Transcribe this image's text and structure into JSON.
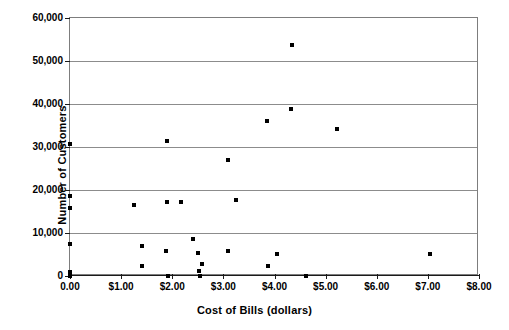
{
  "chart_data": {
    "type": "scatter",
    "title": "",
    "xlabel": "Cost of Bills (dollars)",
    "ylabel": "Number of Customers",
    "xlim": [
      0,
      8
    ],
    "ylim": [
      0,
      60000
    ],
    "grid": "horizontal",
    "legend": "none",
    "marker_color": "#000000",
    "xticks": [
      0,
      1,
      2,
      3,
      4,
      5,
      6,
      7,
      8
    ],
    "xtick_labels": [
      "0.00",
      "$1.00",
      "$2.00",
      "$3.00",
      "$4.00",
      "$5.00",
      "$6.00",
      "$7.00",
      "$8.00"
    ],
    "yticks": [
      0,
      10000,
      20000,
      30000,
      40000,
      50000,
      60000
    ],
    "ytick_labels": [
      "0",
      "10,000",
      "20,000",
      "30,000",
      "40,000",
      "50,000",
      "60,000"
    ],
    "points": [
      {
        "x": 0.0,
        "y": 30700
      },
      {
        "x": 0.0,
        "y": 18500
      },
      {
        "x": 0.0,
        "y": 15800
      },
      {
        "x": 0.0,
        "y": 7400
      },
      {
        "x": 0.0,
        "y": 900
      },
      {
        "x": 0.0,
        "y": 0
      },
      {
        "x": 1.25,
        "y": 16400
      },
      {
        "x": 1.4,
        "y": 7000
      },
      {
        "x": 1.4,
        "y": 2300
      },
      {
        "x": 1.9,
        "y": 31300
      },
      {
        "x": 1.9,
        "y": 17300
      },
      {
        "x": 1.88,
        "y": 5800
      },
      {
        "x": 1.92,
        "y": 0
      },
      {
        "x": 2.18,
        "y": 17200
      },
      {
        "x": 2.4,
        "y": 8600
      },
      {
        "x": 2.5,
        "y": 5400
      },
      {
        "x": 2.58,
        "y": 2800
      },
      {
        "x": 2.52,
        "y": 1100
      },
      {
        "x": 2.55,
        "y": 0
      },
      {
        "x": 3.1,
        "y": 26900
      },
      {
        "x": 3.25,
        "y": 17600
      },
      {
        "x": 3.1,
        "y": 5900
      },
      {
        "x": 3.85,
        "y": 36100
      },
      {
        "x": 3.88,
        "y": 2400
      },
      {
        "x": 4.05,
        "y": 5200
      },
      {
        "x": 4.33,
        "y": 38900
      },
      {
        "x": 4.35,
        "y": 53800
      },
      {
        "x": 4.62,
        "y": 0
      },
      {
        "x": 5.22,
        "y": 34200
      },
      {
        "x": 7.05,
        "y": 5200
      }
    ]
  }
}
